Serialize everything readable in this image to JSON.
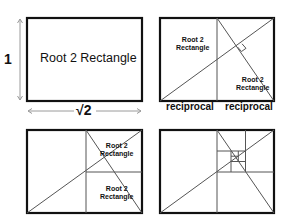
{
  "panels": {
    "a": {
      "title": "Root 2 Rectangle",
      "side_label": "1",
      "bottom_label": "√2"
    },
    "b": {
      "rect_labels": [
        "Root 2",
        "Rectangle",
        "Root 2",
        "Rectangle"
      ],
      "bottom_labels": [
        "reciprocal",
        "reciprocal"
      ]
    },
    "c": {
      "rect_labels": [
        "Root 2",
        "Rectangle",
        "Root 2",
        "Rectangle"
      ]
    },
    "d": {}
  },
  "colors": {
    "frame": "#111111",
    "line": "#555555",
    "arrow": "#9a9a9a"
  }
}
